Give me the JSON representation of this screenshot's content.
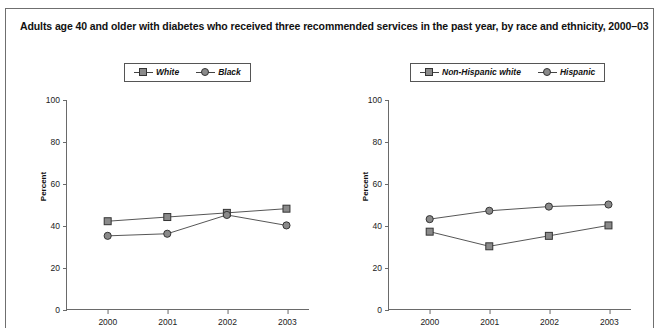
{
  "figure": {
    "title": "Adults age 40 and older with diabetes who received three recommended services in the past year, by race and ethnicity, 2000–03"
  },
  "panels": [
    {
      "id": "race",
      "ylabel": "Percent",
      "legend": [
        {
          "label": "White",
          "marker": "square-marker-icon"
        },
        {
          "label": "Black",
          "marker": "circle-marker-icon"
        }
      ],
      "chart_data": {
        "type": "line",
        "title": "",
        "xlabel": "",
        "ylabel": "Percent",
        "categories": [
          "2000",
          "2001",
          "2002",
          "2003"
        ],
        "x": [
          2000,
          2001,
          2002,
          2003
        ],
        "ylim": [
          0,
          100
        ],
        "yticks": [
          0,
          20,
          40,
          60,
          80,
          100
        ],
        "grid": false,
        "legend_position": "top-center",
        "series": [
          {
            "name": "White",
            "marker": "square",
            "values": [
              42,
              44,
              46,
              48
            ]
          },
          {
            "name": "Black",
            "marker": "circle",
            "values": [
              35,
              36,
              45,
              40
            ]
          }
        ]
      }
    },
    {
      "id": "ethnicity",
      "ylabel": "Percent",
      "legend": [
        {
          "label": "Non-Hispanic white",
          "marker": "square-marker-icon"
        },
        {
          "label": "Hispanic",
          "marker": "circle-marker-icon"
        }
      ],
      "chart_data": {
        "type": "line",
        "title": "",
        "xlabel": "",
        "ylabel": "Percent",
        "categories": [
          "2000",
          "2001",
          "2002",
          "2003"
        ],
        "x": [
          2000,
          2001,
          2002,
          2003
        ],
        "ylim": [
          0,
          100
        ],
        "yticks": [
          0,
          20,
          40,
          60,
          80,
          100
        ],
        "grid": false,
        "legend_position": "top-center",
        "series": [
          {
            "name": "Non-Hispanic white",
            "marker": "square",
            "values": [
              37,
              30,
              35,
              40
            ]
          },
          {
            "name": "Hispanic",
            "marker": "circle",
            "values": [
              43,
              47,
              49,
              50
            ]
          }
        ]
      }
    }
  ],
  "colors": {
    "marker_fill": "#8a8a8a",
    "marker_stroke": "#333333",
    "line": "#555555",
    "axis": "#6a6a6a",
    "frame": "#6f6f6f",
    "text": "#111111"
  }
}
